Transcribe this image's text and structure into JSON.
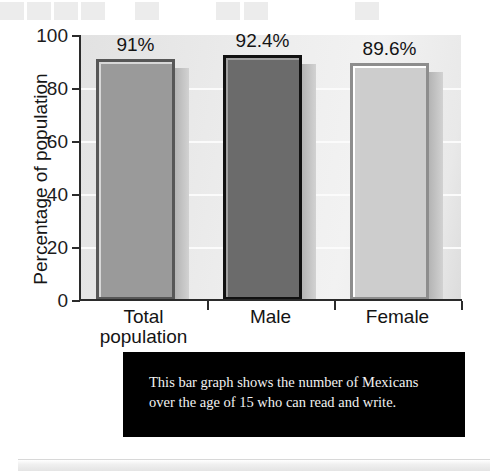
{
  "decoration": {
    "top_squares": [
      {
        "x": 0,
        "w": 24
      },
      {
        "x": 27,
        "w": 24
      },
      {
        "x": 54,
        "w": 24
      },
      {
        "x": 81,
        "w": 24
      },
      {
        "x": 135,
        "w": 24
      },
      {
        "x": 216,
        "w": 24
      },
      {
        "x": 244,
        "w": 24
      },
      {
        "x": 355,
        "w": 24
      }
    ],
    "square_color": "#ececec"
  },
  "chart_data": {
    "type": "bar",
    "title": "",
    "xlabel": "",
    "ylabel": "Percentage of population",
    "categories": [
      "Total population",
      "Male",
      "Female"
    ],
    "category_lines": [
      [
        "Total",
        "population"
      ],
      [
        "Male"
      ],
      [
        "Female"
      ]
    ],
    "values": [
      91,
      92.4,
      89.6
    ],
    "value_labels": [
      "91%",
      "92.4%",
      "89.6%"
    ],
    "ylim": [
      0,
      100
    ],
    "yticks": [
      0,
      20,
      40,
      60,
      80,
      100
    ],
    "ytick_labels": [
      "0",
      "20",
      "40",
      "60",
      "80",
      "100"
    ],
    "grid": true,
    "gridline_values": [
      20,
      40,
      60,
      80
    ],
    "gridline_color": "#fbfbfb",
    "legend": "none",
    "bar_colors": [
      "#9a9a9a",
      "#6b6b6b",
      "#cdcdcd"
    ],
    "bar_border_colors": [
      "#575757",
      "#111111",
      "#8d8d8d"
    ],
    "bar_highlight_colors": [
      "#d8d8d8",
      "#a0a0a0",
      "#ffffff"
    ],
    "plot_background": "#ededed"
  },
  "caption": {
    "text": "This bar graph shows the number of Mexicans\nover the age of 15 who can read and write.",
    "background": "#000000",
    "color": "#f2f2f2"
  }
}
